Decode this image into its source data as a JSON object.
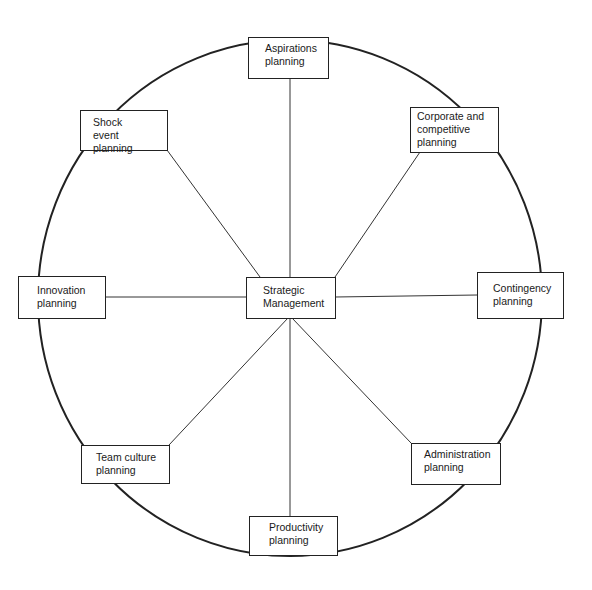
{
  "diagram": {
    "center": {
      "label": "Strategic\nManagement"
    },
    "nodes": [
      {
        "id": "aspirations",
        "label": "Aspirations\nplanning"
      },
      {
        "id": "corporate",
        "label": "Corporate and\ncompetitive\nplanning"
      },
      {
        "id": "contingency",
        "label": "Contingency\nplanning"
      },
      {
        "id": "administration",
        "label": "Administration\nplanning"
      },
      {
        "id": "productivity",
        "label": "Productivity\nplanning"
      },
      {
        "id": "team-culture",
        "label": "Team culture\nplanning"
      },
      {
        "id": "innovation",
        "label": "Innovation\nplanning"
      },
      {
        "id": "shock-event",
        "label": "Shock\nevent planning"
      }
    ],
    "line_color": "#222222",
    "background": "#ffffff"
  }
}
